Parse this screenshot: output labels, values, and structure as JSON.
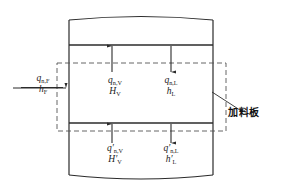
{
  "figure": {
    "type": "process-diagram",
    "colors": {
      "line": "#2b2b2b",
      "dashed": "#555555",
      "background": "#ffffff",
      "text": "#1a1a1a"
    }
  },
  "feed_stream": {
    "flow_symbol": "q",
    "flow_sub": "n,F",
    "enthalpy_symbol": "h",
    "enthalpy_sub": "F",
    "direction": "into-column-from-left"
  },
  "above_plate": {
    "vapor": {
      "flow_symbol": "q",
      "flow_sub": "n,V",
      "enthalpy_symbol": "H",
      "enthalpy_sub": "V",
      "arrow": "up"
    },
    "liquid": {
      "flow_symbol": "q",
      "flow_sub": "n,L",
      "enthalpy_symbol": "h",
      "enthalpy_sub": "L",
      "arrow": "down"
    }
  },
  "below_plate": {
    "vapor": {
      "flow_symbol": "q",
      "flow_prime": "′",
      "flow_sub": "n,V",
      "enthalpy_symbol": "H",
      "enthalpy_prime": "′",
      "enthalpy_sub": "V",
      "arrow": "up"
    },
    "liquid": {
      "flow_symbol": "q",
      "flow_prime": "′",
      "flow_sub": "n,L",
      "enthalpy_symbol": "h",
      "enthalpy_prime": "′",
      "enthalpy_sub": "L",
      "arrow": "down"
    }
  },
  "annotation": {
    "feed_plate_label": "加料板"
  }
}
